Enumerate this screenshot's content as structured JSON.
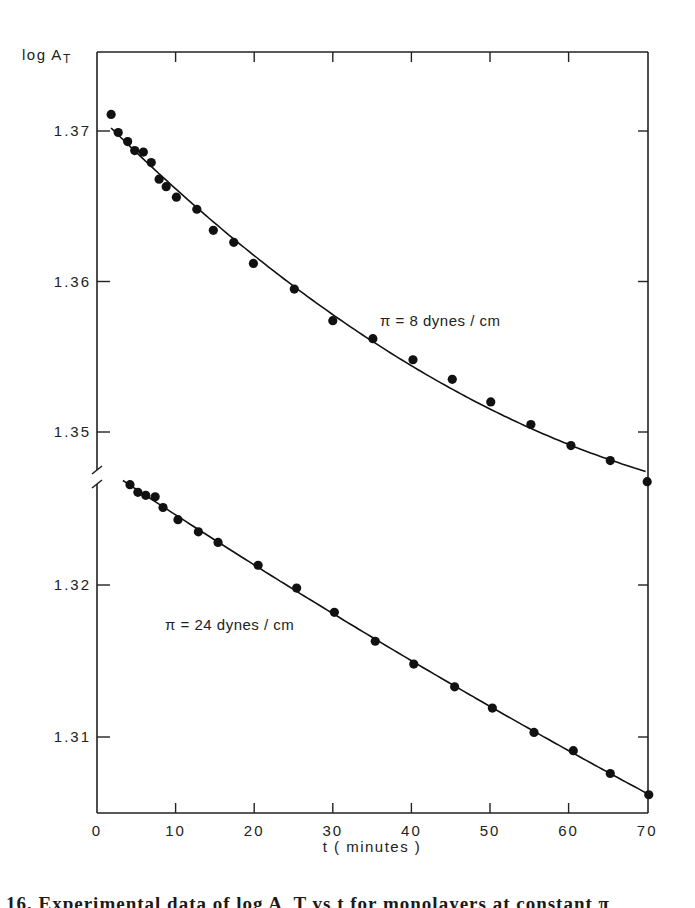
{
  "chart_data": {
    "type": "scatter",
    "title": "",
    "xlabel": "t ( minutes )",
    "ylabel": "log A_T",
    "xlim": [
      0,
      70
    ],
    "x_ticks": [
      0,
      10,
      20,
      30,
      40,
      50,
      60,
      70
    ],
    "x_tick_labels": [
      "0",
      "10",
      "20",
      "30",
      "40",
      "50",
      "60",
      "70"
    ],
    "y_ticks_upper": [
      1.35,
      1.36,
      1.37
    ],
    "y_tick_labels_upper": [
      "1.35",
      "1.36",
      "1.37"
    ],
    "y_ticks_lower": [
      1.31,
      1.32
    ],
    "y_tick_labels_lower": [
      "1.31",
      "1.32"
    ],
    "y_axis_break": true,
    "grid": false,
    "legend": "inline labels beside curves",
    "series": [
      {
        "name": "π = 8 dynes / cm",
        "label_text": "π = 8 dynes / cm",
        "fit": "smooth curve through points",
        "x": [
          1.8,
          2.7,
          3.9,
          4.8,
          5.9,
          6.9,
          7.9,
          8.8,
          10.1,
          12.7,
          14.8,
          17.4,
          19.9,
          25.1,
          30.0,
          35.1,
          40.2,
          45.2,
          50.1,
          55.2,
          60.3,
          65.3,
          70.0
        ],
        "values": [
          1.3711,
          1.3699,
          1.3693,
          1.3687,
          1.3686,
          1.3679,
          1.3668,
          1.3663,
          1.3656,
          1.3648,
          1.3634,
          1.3626,
          1.3612,
          1.3595,
          1.3574,
          1.3562,
          1.3548,
          1.3535,
          1.352,
          1.3505,
          1.3491,
          1.3481,
          1.3467
        ]
      },
      {
        "name": "π = 24 dynes / cm",
        "label_text": "π = 24 dynes / cm",
        "fit": "smooth curve through points",
        "x": [
          4.2,
          5.2,
          6.2,
          7.4,
          8.4,
          10.3,
          12.9,
          15.4,
          20.5,
          25.4,
          30.2,
          35.4,
          40.3,
          45.5,
          50.3,
          55.6,
          60.6,
          65.3,
          70.2
        ],
        "values": [
          1.3266,
          1.3261,
          1.3259,
          1.3258,
          1.3251,
          1.3243,
          1.3235,
          1.3228,
          1.3213,
          1.3198,
          1.3182,
          1.3163,
          1.3148,
          1.3133,
          1.3119,
          1.3103,
          1.3091,
          1.3076,
          1.3062
        ]
      }
    ]
  },
  "labels": {
    "y_axis_title": "log A",
    "y_axis_subscript": "T",
    "x_axis_title": "t ( minutes )",
    "series_upper_label": "π = 8 dynes / cm",
    "series_lower_label": "π = 24 dynes / cm"
  },
  "caption": {
    "text": "16.   Experimental data of log A_T vs t for monolayers at constant π"
  }
}
